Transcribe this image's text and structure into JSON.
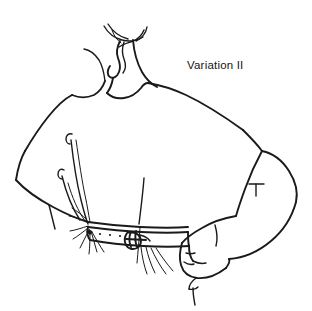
{
  "illustration": {
    "title": "Variation II",
    "subject": "back-view fashion line drawing of draped top with belt",
    "background_color": "#ffffff",
    "ink_color": "#1a1a1a",
    "canvas": {
      "width": 312,
      "height": 311
    },
    "caption": {
      "text": "Variation II",
      "x": 187,
      "y": 59,
      "font_size_px": 11.5
    },
    "parts": [
      {
        "name": "neck-tie",
        "label": "neck tie / scarf ends"
      },
      {
        "name": "neck",
        "label": "neck"
      },
      {
        "name": "left-shoulder",
        "label": "left shoulder"
      },
      {
        "name": "right-shoulder",
        "label": "right shoulder"
      },
      {
        "name": "bodice",
        "label": "draped bodice back"
      },
      {
        "name": "drape-folds",
        "label": "drape fold lines"
      },
      {
        "name": "belt",
        "label": "belt"
      },
      {
        "name": "buckle",
        "label": "belt buckle"
      },
      {
        "name": "belt-holes",
        "label": "belt punch holes"
      },
      {
        "name": "gathered-fabric",
        "label": "gathered fabric at hip"
      },
      {
        "name": "arm",
        "label": "right arm bent at elbow"
      },
      {
        "name": "hand",
        "label": "hand resting on hip"
      },
      {
        "name": "elbow-mark",
        "label": "elbow crease mark"
      }
    ]
  }
}
